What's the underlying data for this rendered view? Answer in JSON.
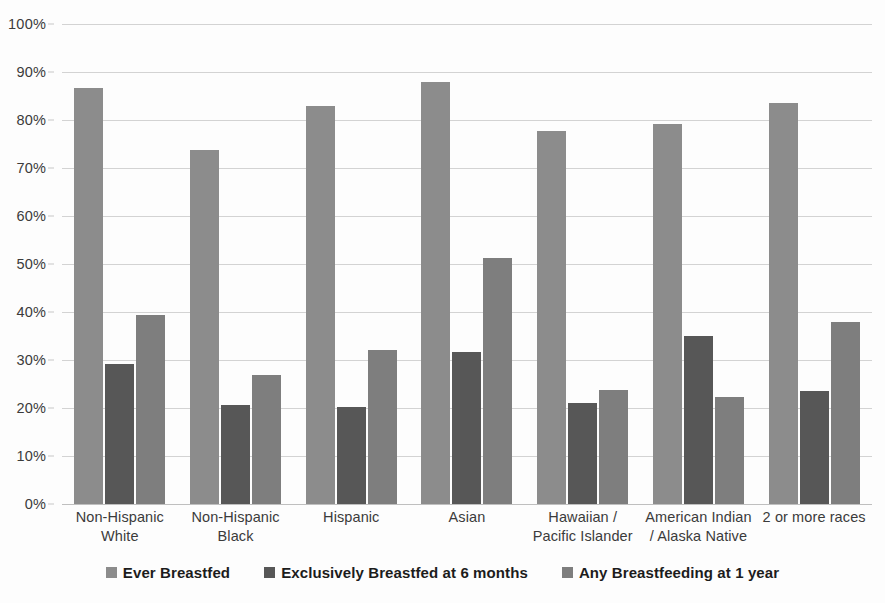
{
  "chart_data": {
    "type": "bar",
    "title": "",
    "xlabel": "",
    "ylabel": "",
    "ylim": [
      0,
      100
    ],
    "y_unit": "%",
    "grid": true,
    "legend_position": "bottom",
    "categories": [
      "Non-Hispanic White",
      "Non-Hispanic Black",
      "Hispanic",
      "Asian",
      "Hawaiian / Pacific Islander",
      "American Indian / Alaska Native",
      "2 or more races"
    ],
    "category_lines": [
      [
        "Non-Hispanic",
        "White"
      ],
      [
        "Non-Hispanic",
        "Black"
      ],
      [
        "Hispanic",
        ""
      ],
      [
        "Asian",
        ""
      ],
      [
        "Hawaiian /",
        "Pacific Islander"
      ],
      [
        "American Indian",
        "/ Alaska Native"
      ],
      [
        "2 or more races",
        ""
      ]
    ],
    "y_ticks": [
      "0%",
      "10%",
      "20%",
      "30%",
      "40%",
      "50%",
      "60%",
      "70%",
      "80%",
      "90%",
      "100%"
    ],
    "y_tick_values": [
      0,
      10,
      20,
      30,
      40,
      50,
      60,
      70,
      80,
      90,
      100
    ],
    "series": [
      {
        "name": "Ever Breastfed",
        "color": "#8c8c8c",
        "values": [
          86.6,
          73.7,
          83.0,
          87.9,
          77.8,
          79.2,
          83.6
        ]
      },
      {
        "name": "Exclusively Breastfed at 6 months",
        "color": "#575757",
        "values": [
          29.2,
          20.6,
          20.3,
          31.6,
          21.0,
          34.9,
          23.6
        ]
      },
      {
        "name": "Any Breastfeeding at 1 year",
        "color": "#7e7e7e",
        "values": [
          39.3,
          26.8,
          32.0,
          51.3,
          23.7,
          22.3,
          37.9
        ]
      }
    ]
  },
  "legend": {
    "items": [
      {
        "label": "Ever Breastfed",
        "color": "#8c8c8c"
      },
      {
        "label": "Exclusively Breastfed at 6 months",
        "color": "#575757"
      },
      {
        "label": "Any Breastfeeding at 1 year",
        "color": "#7e7e7e"
      }
    ]
  }
}
